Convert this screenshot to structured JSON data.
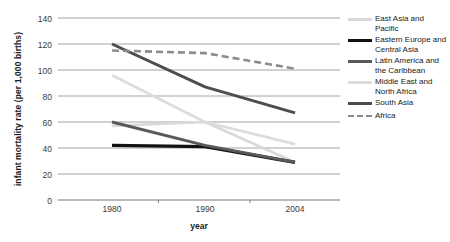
{
  "chart_data": {
    "type": "line",
    "title": "",
    "xlabel": "year",
    "ylabel": "infant mortality rate (per 1,000 births)",
    "x": [
      "1980",
      "1990",
      "2004"
    ],
    "categories": [
      "1980",
      "1990",
      "2004"
    ],
    "ylim": [
      0,
      140
    ],
    "yticks": [
      "0",
      "20",
      "40",
      "60",
      "80",
      "100",
      "120",
      "140"
    ],
    "grid": true,
    "legend_position": "right",
    "series": [
      {
        "name": "East Asia and Pacific",
        "values": [
          57,
          60,
          29
        ],
        "color": "#d9d9d9",
        "style": "solid",
        "width": 2.6
      },
      {
        "name": "Eastern Europe and Central Asia",
        "values": [
          42,
          41,
          29
        ],
        "color": "#111111",
        "style": "solid",
        "width": 3.2
      },
      {
        "name": "Latin America and the Caribbean",
        "values": [
          60,
          42,
          29
        ],
        "color": "#595959",
        "style": "solid",
        "width": 3.0
      },
      {
        "name": "Middle East and North Africa",
        "values": [
          96,
          60,
          43
        ],
        "color": "#dcdcdc",
        "style": "solid",
        "width": 2.8
      },
      {
        "name": "South Asia",
        "values": [
          120,
          87,
          67
        ],
        "color": "#4d4d4d",
        "style": "solid",
        "width": 3.0
      },
      {
        "name": "Africa",
        "values": [
          115,
          113,
          101
        ],
        "color": "#8c8c8c",
        "style": "dashed",
        "width": 2.6
      }
    ]
  },
  "legend": {
    "items": [
      {
        "label": "East Asia and Pacific"
      },
      {
        "label": "Eastern Europe and Central Asia"
      },
      {
        "label": "Latin America and the Caribbean"
      },
      {
        "label": "Middle East and North Africa"
      },
      {
        "label": "South Asia"
      },
      {
        "label": "Africa"
      }
    ]
  },
  "axes": {
    "y_title": "infant mortality rate (per 1,000 births)",
    "x_title": "year",
    "y_ticks": [
      "140",
      "120",
      "100",
      "80",
      "60",
      "40",
      "20",
      "0"
    ],
    "x_ticks": [
      "1980",
      "1990",
      "2004"
    ]
  },
  "colors": {
    "grid": "#9a9a9a",
    "axis": "#777777",
    "text": "#2a2a2a"
  }
}
